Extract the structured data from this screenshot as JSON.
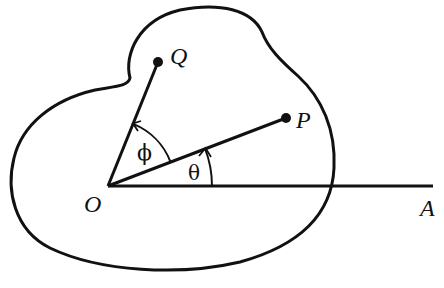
{
  "figure": {
    "type": "geometry-diagram",
    "colors": {
      "ink": "#111111",
      "background": "#ffffff"
    },
    "labels": {
      "origin": "O",
      "ray_end": "A",
      "point_p": "P",
      "point_q": "Q",
      "angle_theta": "θ",
      "angle_phi": "ϕ"
    },
    "points": {
      "O": [
        108,
        186
      ],
      "A": [
        433,
        186
      ],
      "P": [
        286,
        118
      ],
      "Q": [
        158,
        62
      ]
    },
    "angles": {
      "theta": {
        "from": "OA",
        "to": "OP",
        "arc_radius": 104
      },
      "phi": {
        "from": "OP",
        "to": "OQ",
        "arc_radius": 67
      }
    }
  }
}
